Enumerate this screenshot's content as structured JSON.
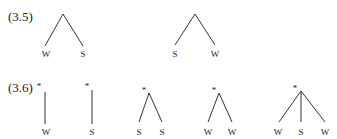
{
  "examples": [
    {
      "label": "(3.5)",
      "trees": [
        {
          "starred": false,
          "leaves": [
            "W",
            "S"
          ]
        },
        {
          "starred": false,
          "leaves": [
            "S",
            "W"
          ]
        }
      ]
    },
    {
      "label": "(3.6)",
      "trees": [
        {
          "starred": true,
          "star": "*",
          "leaves": [
            "W"
          ]
        },
        {
          "starred": true,
          "star": "*",
          "leaves": [
            "S"
          ]
        },
        {
          "starred": true,
          "star": "*",
          "leaves": [
            "S",
            "S"
          ]
        },
        {
          "starred": true,
          "star": "*",
          "leaves": [
            "W",
            "W"
          ]
        },
        {
          "starred": true,
          "star": "*",
          "leaves": [
            "W",
            "S",
            "W"
          ]
        }
      ]
    }
  ],
  "colors": {
    "ink": "#222222",
    "background": "#ffffff"
  }
}
